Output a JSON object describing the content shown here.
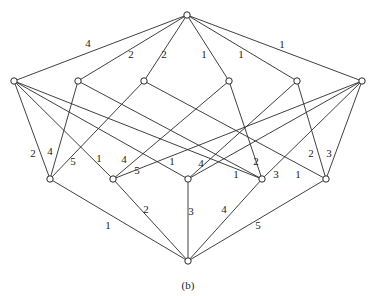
{
  "caption": "(b)",
  "colors": {
    "stroke": "#2a2a2a",
    "background": "#ffffff"
  },
  "nodes": [
    {
      "id": "T",
      "x": 187,
      "y": 15
    },
    {
      "id": "M1",
      "x": 14,
      "y": 81
    },
    {
      "id": "M2",
      "x": 78,
      "y": 81
    },
    {
      "id": "M3",
      "x": 144,
      "y": 81
    },
    {
      "id": "M4",
      "x": 229,
      "y": 81
    },
    {
      "id": "M5",
      "x": 297,
      "y": 81
    },
    {
      "id": "M6",
      "x": 362,
      "y": 81
    },
    {
      "id": "L1",
      "x": 50,
      "y": 179
    },
    {
      "id": "L2",
      "x": 113,
      "y": 179
    },
    {
      "id": "L3",
      "x": 188,
      "y": 179
    },
    {
      "id": "L4",
      "x": 262,
      "y": 179
    },
    {
      "id": "L5",
      "x": 326,
      "y": 179
    },
    {
      "id": "B",
      "x": 188,
      "y": 261
    }
  ],
  "edges": [
    {
      "from": "T",
      "to": "M1",
      "label": "4",
      "lx": 88,
      "ly": 47
    },
    {
      "from": "T",
      "to": "M2",
      "label": "2",
      "lx": 131,
      "ly": 58
    },
    {
      "from": "T",
      "to": "M3",
      "label": "2",
      "lx": 164,
      "ly": 58
    },
    {
      "from": "T",
      "to": "M4",
      "label": "1",
      "lx": 204,
      "ly": 58
    },
    {
      "from": "T",
      "to": "M5",
      "label": "1",
      "lx": 241,
      "ly": 58
    },
    {
      "from": "T",
      "to": "M6",
      "label": "1",
      "lx": 282,
      "ly": 48
    },
    {
      "from": "M1",
      "to": "L1",
      "label": "2",
      "lx": 33,
      "ly": 157
    },
    {
      "from": "M1",
      "to": "L2",
      "label": "1",
      "lx": 99,
      "ly": 162
    },
    {
      "from": "M1",
      "to": "L3",
      "label": "1",
      "lx": 172,
      "ly": 165
    },
    {
      "from": "M1",
      "to": "L4",
      "label": "",
      "lx": 0,
      "ly": 0
    },
    {
      "from": "M2",
      "to": "L1",
      "label": "4",
      "lx": 50,
      "ly": 155
    },
    {
      "from": "M2",
      "to": "L4",
      "label": "1",
      "lx": 236,
      "ly": 178
    },
    {
      "from": "M3",
      "to": "L1",
      "label": "5",
      "lx": 73,
      "ly": 165
    },
    {
      "from": "M3",
      "to": "L5",
      "label": "1",
      "lx": 298,
      "ly": 178
    },
    {
      "from": "M4",
      "to": "L2",
      "label": "4",
      "lx": 124,
      "ly": 163
    },
    {
      "from": "M4",
      "to": "L4",
      "label": "2",
      "lx": 256,
      "ly": 165
    },
    {
      "from": "M5",
      "to": "L3",
      "label": "4",
      "lx": 201,
      "ly": 167
    },
    {
      "from": "M5",
      "to": "L5",
      "label": "2",
      "lx": 311,
      "ly": 157
    },
    {
      "from": "M6",
      "to": "L2",
      "label": "5",
      "lx": 137,
      "ly": 174
    },
    {
      "from": "M6",
      "to": "L3",
      "label": "",
      "lx": 0,
      "ly": 0
    },
    {
      "from": "M6",
      "to": "L4",
      "label": "3",
      "lx": 276,
      "ly": 178
    },
    {
      "from": "M6",
      "to": "L5",
      "label": "3",
      "lx": 329,
      "ly": 157
    },
    {
      "from": "L1",
      "to": "B",
      "label": "1",
      "lx": 108,
      "ly": 229
    },
    {
      "from": "L2",
      "to": "B",
      "label": "2",
      "lx": 146,
      "ly": 213
    },
    {
      "from": "L3",
      "to": "B",
      "label": "3",
      "lx": 191,
      "ly": 215
    },
    {
      "from": "L4",
      "to": "B",
      "label": "4",
      "lx": 224,
      "ly": 213
    },
    {
      "from": "L5",
      "to": "B",
      "label": "5",
      "lx": 258,
      "ly": 229
    }
  ]
}
